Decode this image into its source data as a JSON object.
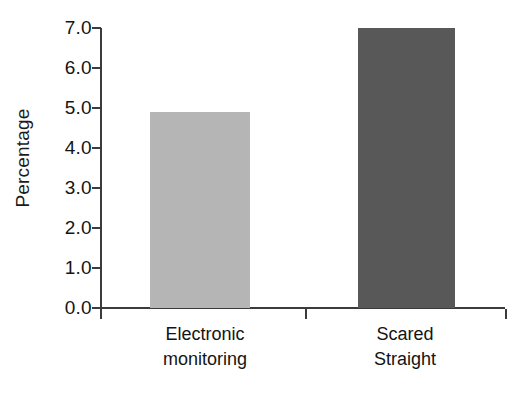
{
  "chart_data": {
    "type": "bar",
    "title": "",
    "xlabel": "",
    "ylabel": "Percentage",
    "categories": [
      "Electronic monitoring",
      "Scared Straight"
    ],
    "values": [
      4.9,
      7.0
    ],
    "ylim": [
      0.0,
      7.0
    ],
    "ytick_step": 1.0,
    "ytick_labels": [
      "0.0",
      "1.0",
      "2.0",
      "3.0",
      "4.0",
      "5.0",
      "6.0",
      "7.0"
    ],
    "ytick_values": [
      0.0,
      1.0,
      2.0,
      3.0,
      4.0,
      5.0,
      6.0,
      7.0
    ],
    "grid": false,
    "legend": "none",
    "bars": [
      {
        "label_line1": "Electronic",
        "label_line2": "monitoring",
        "value": 4.9,
        "color": "#b5b5b5"
      },
      {
        "label_line1": "Scared",
        "label_line2": "Straight",
        "value": 7.0,
        "color": "#585858"
      }
    ],
    "colors": {
      "axis": "#3b3b3b",
      "text": "#141414",
      "background": "#ffffff",
      "bar_light": "#b5b5b5",
      "bar_dark": "#585858"
    }
  }
}
